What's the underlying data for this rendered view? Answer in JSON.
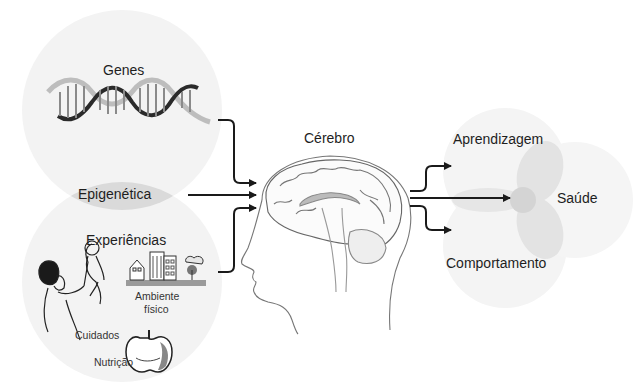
{
  "diagram": {
    "type": "flow",
    "inputs": {
      "genes": {
        "label": "Genes",
        "icon": "dna-helix-icon"
      },
      "epigenetics": {
        "label": "Epigenética"
      },
      "experiences": {
        "label": "Experiências",
        "items": [
          {
            "label": "Cuidados",
            "icon": "parent-lifting-child-icon"
          },
          {
            "label": "Ambiente físico",
            "label_line1": "Ambiente",
            "label_line2": "físico",
            "icon": "buildings-icon"
          },
          {
            "label": "Nutrição",
            "icon": "apple-icon"
          }
        ]
      }
    },
    "center": {
      "label": "Cérebro",
      "icon": "head-brain-icon"
    },
    "outputs": [
      {
        "label": "Aprendizagem"
      },
      {
        "label": "Saúde"
      },
      {
        "label": "Comportamento"
      }
    ],
    "edges": [
      {
        "from": "Genes",
        "to": "Cérebro"
      },
      {
        "from": "Epigenética",
        "to": "Cérebro"
      },
      {
        "from": "Experiências",
        "to": "Cérebro"
      },
      {
        "from": "Cérebro",
        "to": "Aprendizagem"
      },
      {
        "from": "Cérebro",
        "to": "Saúde"
      },
      {
        "from": "Cérebro",
        "to": "Comportamento"
      }
    ],
    "colors": {
      "circle_fill": "#f2f2f2",
      "overlap_fill": "#d9d9d9",
      "arrow": "#1a1a1a",
      "line_art": "#777777"
    }
  }
}
